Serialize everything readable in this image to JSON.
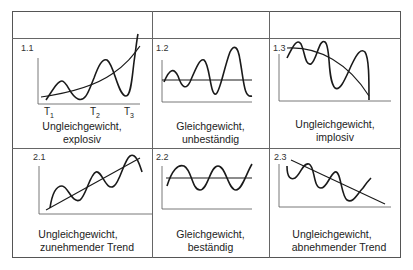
{
  "title": "",
  "header_row": [
    "",
    "",
    ""
  ],
  "panels": [
    {
      "id": "1.1",
      "caption_line1": "Ungleichgewicht,",
      "caption_line2": "explosiv",
      "ticks": [
        "T",
        "T",
        "T"
      ],
      "tick_subs": [
        "1",
        "2",
        "3"
      ],
      "type": "explosive disequilibrium"
    },
    {
      "id": "1.2",
      "caption_line1": "Gleichgewicht,",
      "caption_line2": "unbeständig",
      "type": "unstable equilibrium"
    },
    {
      "id": "1.3",
      "caption_line1": "Ungleichgewicht,",
      "caption_line2": "implosiv",
      "type": "implosive disequilibrium"
    },
    {
      "id": "2.1",
      "caption_line1": "Ungleichgewicht,",
      "caption_line2": "zunehmender Trend",
      "type": "disequilibrium increasing trend"
    },
    {
      "id": "2.2",
      "caption_line1": "Gleichgewicht,",
      "caption_line2": "beständig",
      "type": "stable equilibrium"
    },
    {
      "id": "2.3",
      "caption_line1": "Ungleichgewicht,",
      "caption_line2": "abnehmender Trend",
      "type": "disequilibrium decreasing trend"
    }
  ],
  "colors": {
    "line": "#1a1a1a",
    "grid": "#666666",
    "background": "#ffffff"
  }
}
